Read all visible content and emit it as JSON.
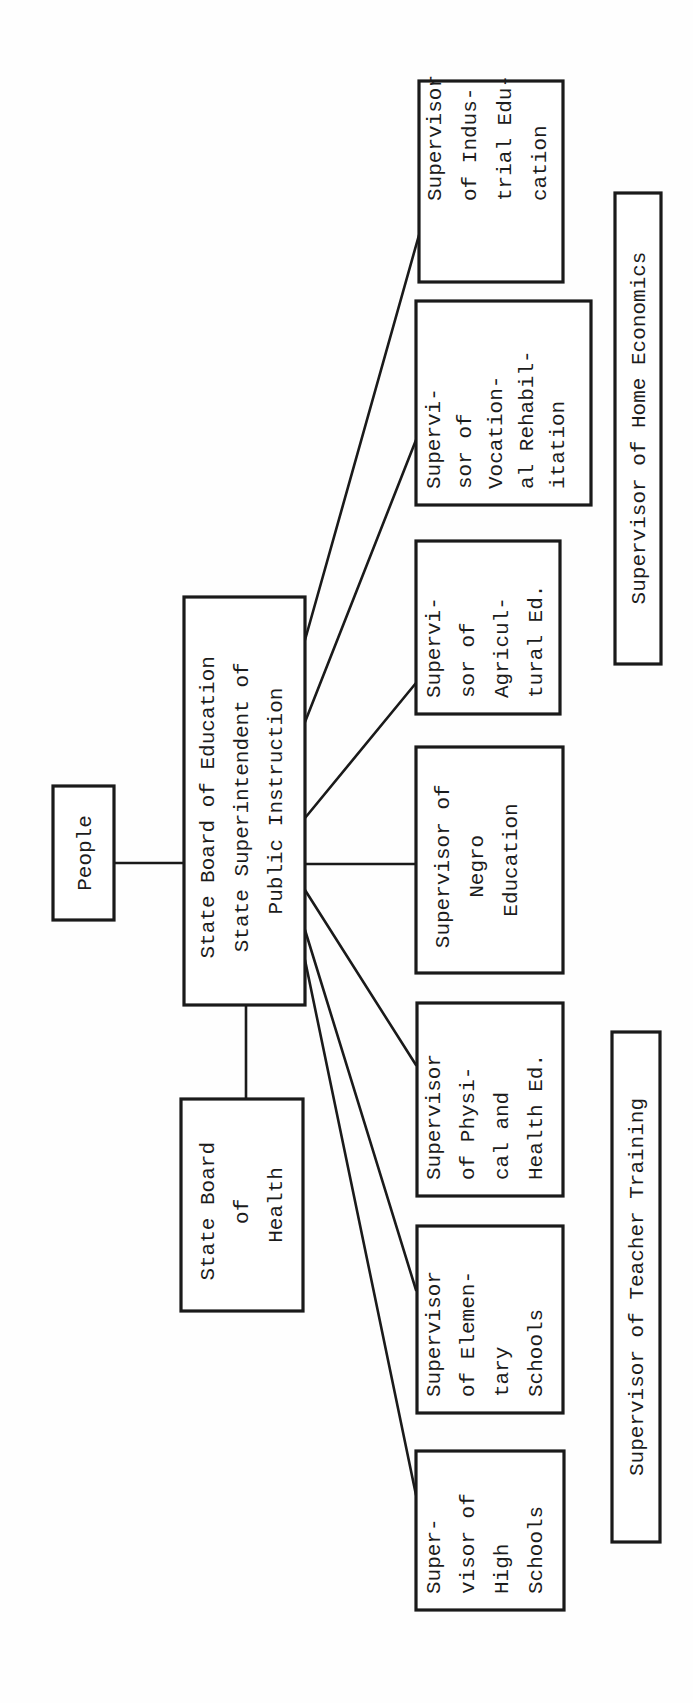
{
  "chart_title": "Organization chart: State Board of Education",
  "orientation": "rotated 90° counter-clockwise",
  "colors": {
    "ink": "#1a1a1a",
    "paper": "#fefefe"
  },
  "nodes": {
    "people": {
      "lines": [
        "People"
      ]
    },
    "central": {
      "lines": [
        "State Board of Education",
        "State Superintendent of",
        "Public Instruction"
      ]
    },
    "health": {
      "lines": [
        "State Board",
        "of",
        "Health"
      ]
    },
    "industrial": {
      "lines": [
        "Supervisor",
        "of Indus-",
        "trial Edu-",
        "cation"
      ]
    },
    "vocational": {
      "lines": [
        "Supervi-",
        "sor of",
        "Vocation-",
        "al Rehabil-",
        "itation"
      ]
    },
    "agricultural": {
      "lines": [
        "Supervi-",
        "sor of",
        "Agricul-",
        "tural Ed."
      ]
    },
    "negro": {
      "lines": [
        "Supervisor of",
        "Negro",
        "Education"
      ]
    },
    "physical": {
      "lines": [
        "Supervisor",
        "of Physi-",
        "cal and",
        "Health Ed."
      ]
    },
    "elementary": {
      "lines": [
        "Supervisor",
        "of Elemen-",
        "tary",
        "Schools"
      ]
    },
    "high": {
      "lines": [
        "Super-",
        "visor of",
        "High",
        "Schools"
      ]
    },
    "home_economics": {
      "lines": [
        "Supervisor of Home Economics"
      ]
    },
    "teacher_training": {
      "lines": [
        "Supervisor of Teacher Training"
      ]
    }
  },
  "edges": [
    [
      "people",
      "central"
    ],
    [
      "central",
      "health"
    ],
    [
      "central",
      "industrial"
    ],
    [
      "central",
      "vocational"
    ],
    [
      "central",
      "agricultural"
    ],
    [
      "central",
      "negro"
    ],
    [
      "central",
      "physical"
    ],
    [
      "central",
      "elementary"
    ],
    [
      "central",
      "high"
    ]
  ]
}
